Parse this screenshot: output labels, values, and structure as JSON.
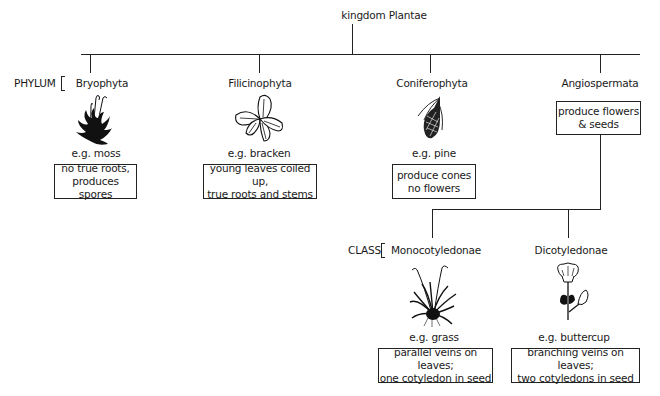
{
  "diagram": {
    "type": "classification-tree",
    "root": {
      "label": "kingdom Plantae"
    },
    "rank_labels": {
      "phylum": "PHYLUM",
      "class": "CLASS"
    },
    "phyla": [
      {
        "name": "Bryophyta",
        "example": "e.g. moss",
        "icon": "moss-icon",
        "description": "no true roots,\nproduces spores"
      },
      {
        "name": "Filicinophyta",
        "example": "e.g. bracken",
        "icon": "fern-icon",
        "description": "young leaves coiled up,\ntrue roots  and stems"
      },
      {
        "name": "Coniferophyta",
        "example": "e.g. pine",
        "icon": "pine-cone-icon",
        "description": "produce cones\nno flowers"
      },
      {
        "name": "Angiospermata",
        "example": "",
        "icon": "",
        "description": "produce flowers\n& seeds"
      }
    ],
    "classes": [
      {
        "name": "Monocotyledonae",
        "example": "e.g. grass",
        "icon": "grass-icon",
        "description": "parallel veins on leaves;\none cotyledon in seed"
      },
      {
        "name": "Dicotyledonae",
        "example": "e.g. buttercup",
        "icon": "buttercup-icon",
        "description": "branching veins on leaves;\ntwo cotyledons in seed"
      }
    ]
  }
}
